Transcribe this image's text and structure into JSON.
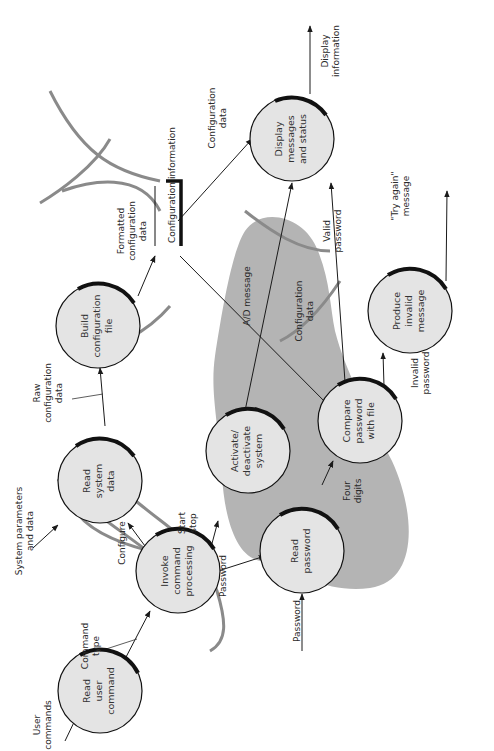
{
  "diagram": {
    "type": "data-flow-diagram",
    "orientation": "rotated-90-ccw",
    "colors": {
      "bubble_fill": "#e4e4e4",
      "bubble_stroke": "#111111",
      "group_fill": "#b4b4b4",
      "arc_stroke": "#8a8a8a",
      "line": "#1a1a1a"
    },
    "processes": [
      {
        "id": "read_user_command",
        "lines": [
          "Read",
          "user",
          "command"
        ]
      },
      {
        "id": "invoke_command_processing",
        "lines": [
          "Invoke",
          "command",
          "processing"
        ]
      },
      {
        "id": "read_system_data",
        "lines": [
          "Read",
          "system",
          "data"
        ]
      },
      {
        "id": "build_configuration_file",
        "lines": [
          "Build",
          "configuration",
          "file"
        ]
      },
      {
        "id": "activate_deactivate_system",
        "lines": [
          "Activate/",
          "deactivate",
          "system"
        ]
      },
      {
        "id": "display_messages_and_status",
        "lines": [
          "Display",
          "messages",
          "and status"
        ]
      },
      {
        "id": "read_password",
        "lines": [
          "Read",
          "password"
        ]
      },
      {
        "id": "compare_password_with_file",
        "lines": [
          "Compare",
          "password",
          "with file"
        ]
      },
      {
        "id": "produce_invalid_message",
        "lines": [
          "Produce",
          "invalid",
          "message"
        ]
      }
    ],
    "data_store": {
      "id": "configuration_information",
      "label": "Configuration information"
    },
    "flows": [
      {
        "from": "external",
        "to": "read_user_command",
        "lines": [
          "User",
          "commands"
        ]
      },
      {
        "from": "read_user_command",
        "to": "invoke_command_processing",
        "lines": [
          "Command",
          "type"
        ]
      },
      {
        "from": "invoke_command_processing",
        "to": "read_system_data",
        "lines": [
          "Configure"
        ]
      },
      {
        "from": "invoke_command_processing",
        "to": "activate_deactivate_system",
        "lines": [
          "Start",
          "stop"
        ]
      },
      {
        "from": "invoke_command_processing",
        "to": "read_password",
        "lines": [
          "Password"
        ]
      },
      {
        "from": "external",
        "to": "read_system_data",
        "lines": [
          "System parameters",
          "and data"
        ]
      },
      {
        "from": "read_system_data",
        "to": "build_configuration_file",
        "lines": [
          "Raw",
          "configuration",
          "data"
        ]
      },
      {
        "from": "build_configuration_file",
        "to": "configuration_information",
        "lines": [
          "Formatted",
          "configuration",
          "data"
        ]
      },
      {
        "from": "configuration_information",
        "to": "display_messages_and_status",
        "lines": [
          "Configuration",
          "data"
        ]
      },
      {
        "from": "configuration_information",
        "to": "compare_password_with_file",
        "lines": [
          "Configuration",
          "data"
        ]
      },
      {
        "from": "activate_deactivate_system",
        "to": "display_messages_and_status",
        "lines": [
          "A/D message"
        ]
      },
      {
        "from": "compare_password_with_file",
        "to": "display_messages_and_status",
        "lines": [
          "Valid",
          "password"
        ]
      },
      {
        "from": "display_messages_and_status",
        "to": "external",
        "lines": [
          "Display",
          "information"
        ]
      },
      {
        "from": "external",
        "to": "read_password",
        "lines": [
          "Password"
        ]
      },
      {
        "from": "read_password",
        "to": "compare_password_with_file",
        "lines": [
          "Four",
          "digits"
        ]
      },
      {
        "from": "compare_password_with_file",
        "to": "produce_invalid_message",
        "lines": [
          "Invalid",
          "password"
        ]
      },
      {
        "from": "produce_invalid_message",
        "to": "external",
        "lines": [
          "\"Try again\"",
          "message"
        ]
      }
    ]
  }
}
